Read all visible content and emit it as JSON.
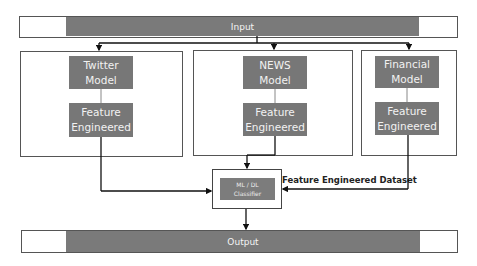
{
  "input_bar": {
    "label": "Input"
  },
  "output_bar": {
    "label": "Output"
  },
  "panels": [
    {
      "model_line1": "Twitter",
      "model_line2": "Model",
      "feature_line1": "Feature",
      "feature_line2": "Engineered"
    },
    {
      "model_line1": "NEWS",
      "model_line2": "Model",
      "feature_line1": "Feature",
      "feature_line2": "Engineered"
    },
    {
      "model_line1": "Financial",
      "model_line2": "Model",
      "feature_line1": "Feature",
      "feature_line2": "Engineered"
    }
  ],
  "classifier": {
    "line1": "ML / DL",
    "line2": "Classifier"
  },
  "dataset_label": "Feature Engineered Dataset",
  "colors": {
    "box_gray": "#777777",
    "border": "#555555",
    "line": "#111111"
  }
}
